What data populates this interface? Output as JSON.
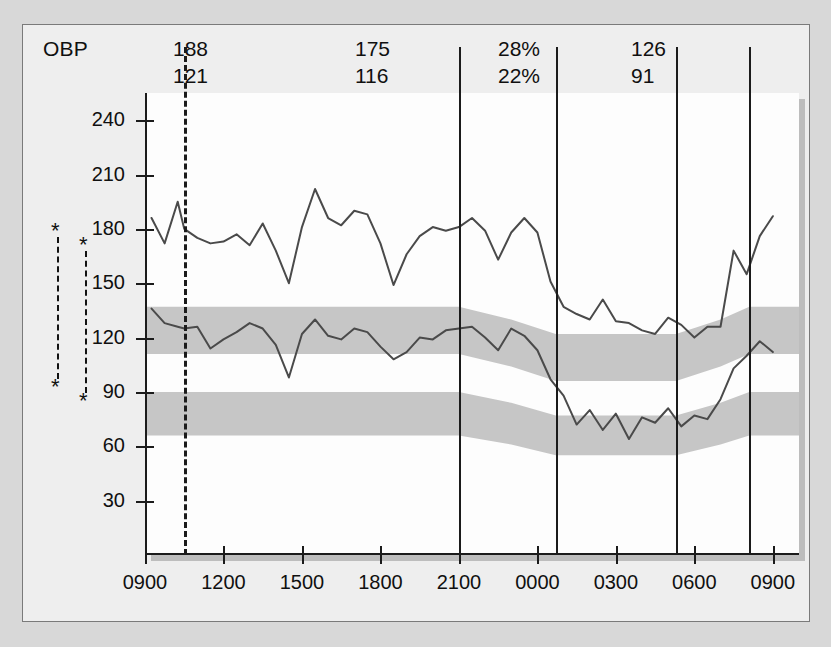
{
  "header": {
    "label": "OBP",
    "readouts": [
      {
        "name": "office-bp-1",
        "x": 150,
        "top": "188",
        "bottom": "121"
      },
      {
        "name": "office-bp-2",
        "x": 332,
        "top": "175",
        "bottom": "116"
      },
      {
        "name": "dip-percent",
        "x": 475,
        "top": "28%",
        "bottom": "22%"
      },
      {
        "name": "office-bp-3",
        "x": 608,
        "top": "126",
        "bottom": "91"
      }
    ]
  },
  "markers": {
    "left_asterisk": "*",
    "right_asterisk": "*"
  },
  "chart_data": {
    "type": "line",
    "xlabel": "",
    "ylabel": "",
    "ylim": [
      0,
      255
    ],
    "xlim": [
      0,
      25
    ],
    "grid": false,
    "legend": "none",
    "yticks": [
      30,
      60,
      90,
      120,
      150,
      180,
      210,
      240
    ],
    "ytick_labels": [
      "30",
      "60",
      "90",
      "120",
      "150",
      "180",
      "210",
      "240"
    ],
    "xticks": [
      0,
      3,
      6,
      9,
      12,
      15,
      18,
      21,
      24
    ],
    "xtick_labels": [
      "0900",
      "1200",
      "1500",
      "1800",
      "2100",
      "0000",
      "0300",
      "0600",
      "0900"
    ],
    "dividers": [
      {
        "hour": 12.0,
        "style": "solid"
      },
      {
        "hour": 15.7,
        "style": "solid"
      },
      {
        "hour": 20.3,
        "style": "solid"
      },
      {
        "hour": 23.1,
        "style": "solid"
      },
      {
        "hour": 1.5,
        "style": "dashed"
      }
    ],
    "series": [
      {
        "name": "Systolic",
        "x": [
          0.25,
          0.75,
          1.25,
          1.5,
          2.0,
          2.5,
          3.0,
          3.5,
          4.0,
          4.5,
          5.0,
          5.5,
          6.0,
          6.5,
          7.0,
          7.5,
          8.0,
          8.5,
          9.0,
          9.5,
          10.0,
          10.5,
          11.0,
          11.5,
          12.0,
          12.5,
          13.0,
          13.5,
          14.0,
          14.5,
          15.0,
          15.5,
          16.0,
          16.5,
          17.0,
          17.5,
          18.0,
          18.5,
          19.0,
          19.5,
          20.0,
          20.5,
          21.0,
          21.5,
          22.0,
          22.5,
          23.0,
          23.5,
          24.0
        ],
        "values": [
          186,
          172,
          195,
          180,
          175,
          172,
          173,
          177,
          171,
          183,
          168,
          150,
          181,
          202,
          186,
          182,
          190,
          188,
          172,
          149,
          166,
          176,
          181,
          179,
          181,
          186,
          179,
          163,
          178,
          186,
          178,
          151,
          137,
          133,
          130,
          141,
          129,
          128,
          124,
          122,
          131,
          127,
          120,
          126,
          126,
          168,
          155,
          176,
          187
        ]
      },
      {
        "name": "Diastolic",
        "x": [
          0.25,
          0.75,
          1.25,
          1.5,
          2.0,
          2.5,
          3.0,
          3.5,
          4.0,
          4.5,
          5.0,
          5.5,
          6.0,
          6.5,
          7.0,
          7.5,
          8.0,
          8.5,
          9.0,
          9.5,
          10.0,
          10.5,
          11.0,
          11.5,
          12.0,
          12.5,
          13.0,
          13.5,
          14.0,
          14.5,
          15.0,
          15.5,
          16.0,
          16.5,
          17.0,
          17.5,
          18.0,
          18.5,
          19.0,
          19.5,
          20.0,
          20.5,
          21.0,
          21.5,
          22.0,
          22.5,
          23.0,
          23.5,
          24.0
        ],
        "values": [
          136,
          128,
          126,
          125,
          126,
          114,
          119,
          123,
          128,
          125,
          116,
          98,
          122,
          130,
          121,
          119,
          125,
          123,
          115,
          108,
          112,
          120,
          119,
          124,
          125,
          126,
          120,
          113,
          125,
          121,
          113,
          97,
          88,
          72,
          80,
          69,
          78,
          64,
          76,
          73,
          81,
          71,
          77,
          75,
          86,
          103,
          110,
          118,
          112
        ]
      }
    ],
    "reference_bands": [
      {
        "name": "systolic-normal-band",
        "color": "#c6c6c6",
        "x": [
          0,
          12,
          14,
          15.7,
          20.3,
          22.0,
          23.1,
          25
        ],
        "upper": [
          137,
          137,
          130,
          122,
          122,
          130,
          137,
          137
        ],
        "lower": [
          111,
          111,
          104,
          96,
          96,
          104,
          111,
          111
        ]
      },
      {
        "name": "diastolic-normal-band",
        "color": "#c6c6c6",
        "x": [
          0,
          12,
          14,
          15.7,
          20.3,
          22.0,
          23.1,
          25
        ],
        "upper": [
          90,
          90,
          84,
          77,
          77,
          84,
          90,
          90
        ],
        "lower": [
          66,
          66,
          61,
          55,
          55,
          61,
          66,
          66
        ]
      }
    ],
    "colors": {
      "trace": "#4a4a4a",
      "band": "#c6c6c6",
      "axis": "#1b1b1b",
      "panel": "#fdfdfd",
      "card": "#eeeeee",
      "page": "#d8d8d8"
    }
  }
}
